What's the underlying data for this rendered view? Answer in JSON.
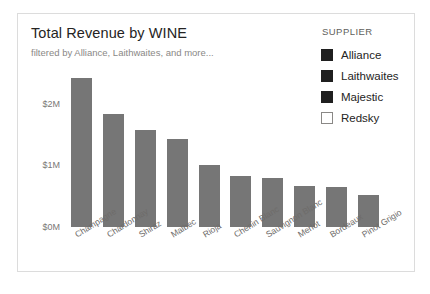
{
  "card": {
    "title": "Total Revenue by WINE",
    "subtitle": "filtered by Alliance, Laithwaites, and more..."
  },
  "legend": {
    "title": "SUPPLIER",
    "items": [
      {
        "label": "Alliance",
        "color": "#1f1f1f",
        "filled": true
      },
      {
        "label": "Laithwaites",
        "color": "#1f1f1f",
        "filled": true
      },
      {
        "label": "Majestic",
        "color": "#1f1f1f",
        "filled": true
      },
      {
        "label": "Redsky",
        "color": "#ffffff",
        "filled": false
      }
    ]
  },
  "colors": {
    "bar": "#767676",
    "card_border": "#dcdcdc",
    "axis_text": "#7a7876",
    "title_text": "#252423",
    "subtitle_text": "#8a8886"
  },
  "chart_data": {
    "type": "bar",
    "title": "Total Revenue by WINE",
    "subtitle": "filtered by Alliance, Laithwaites, and more...",
    "xlabel": "",
    "ylabel": "",
    "ylim": [
      0,
      2450000
    ],
    "grid": false,
    "legend_position": "right",
    "ytick_labels": [
      "$0M",
      "$1M",
      "$2M"
    ],
    "ytick_values": [
      0,
      1000000,
      2000000
    ],
    "categories": [
      "Champagne",
      "Chardonnay",
      "Shiraz",
      "Malbec",
      "Rioja",
      "Chenin Blanc",
      "Sauvignon Blanc",
      "Merlot",
      "Bordeaux",
      "Pinot Grigio"
    ],
    "values": [
      2420000,
      1830000,
      1570000,
      1420000,
      1000000,
      830000,
      800000,
      660000,
      650000,
      520000
    ],
    "series": [
      {
        "name": "Total Revenue",
        "values": [
          2420000,
          1830000,
          1570000,
          1420000,
          1000000,
          830000,
          800000,
          660000,
          650000,
          520000
        ]
      }
    ]
  }
}
